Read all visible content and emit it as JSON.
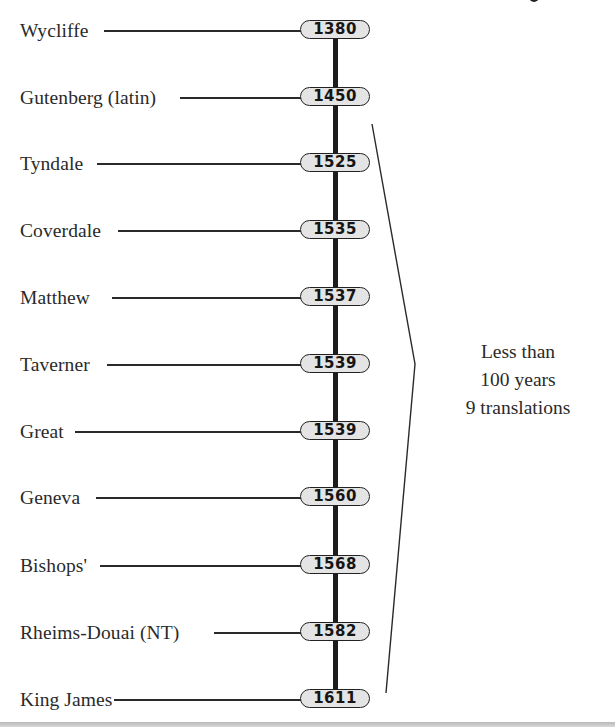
{
  "diagram": {
    "type": "timeline",
    "title_fragment_visible": "",
    "entries": [
      {
        "name": "Wycliffe",
        "year": "1380"
      },
      {
        "name": "Gutenberg (latin)",
        "year": "1450"
      },
      {
        "name": "Tyndale",
        "year": "1525"
      },
      {
        "name": "Coverdale",
        "year": "1535"
      },
      {
        "name": "Matthew",
        "year": "1537"
      },
      {
        "name": "Taverner",
        "year": "1539"
      },
      {
        "name": "Great",
        "year": "1539"
      },
      {
        "name": "Geneva",
        "year": "1560"
      },
      {
        "name": "Bishops'",
        "year": "1568"
      },
      {
        "name": "Rheims-Douai (NT)",
        "year": "1582"
      },
      {
        "name": "King James",
        "year": "1611"
      }
    ],
    "bracket": {
      "spans_from": "1525",
      "spans_to": "1611",
      "annotation": [
        "Less than",
        "100 years",
        "9 translations"
      ]
    },
    "colors": {
      "line": "#222222",
      "pill_fill": "#e4e4e4",
      "pill_border": "#222222",
      "background": "#ffffff",
      "footer_rule": "#c4c4c4"
    }
  }
}
